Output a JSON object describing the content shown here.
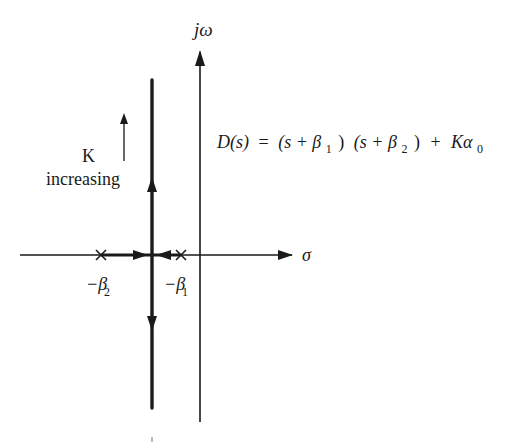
{
  "figure": {
    "type": "root-locus",
    "axes": {
      "imag_label": "jω",
      "real_label": "σ"
    },
    "equation": {
      "lhs": "D(s)",
      "equals": "=",
      "term1_open": "(s + β",
      "term1_sub": "1",
      "term1_close": ")",
      "term2_open": "(s + β",
      "term2_sub": "2",
      "term2_close": ")",
      "plus": "+",
      "gain": "Kα",
      "gain_sub": "0",
      "full_text": "D(s) = (s + β1) (s + β2) + Kα0"
    },
    "annotation": {
      "k_label": "K",
      "increasing_label": "increasing"
    },
    "poles": [
      {
        "label": "−β",
        "sub": "2",
        "marker": "×"
      },
      {
        "label": "−β",
        "sub": "1",
        "marker": "×"
      }
    ],
    "colors": {
      "ink": "#1a1a1a",
      "background": "#ffffff"
    }
  }
}
